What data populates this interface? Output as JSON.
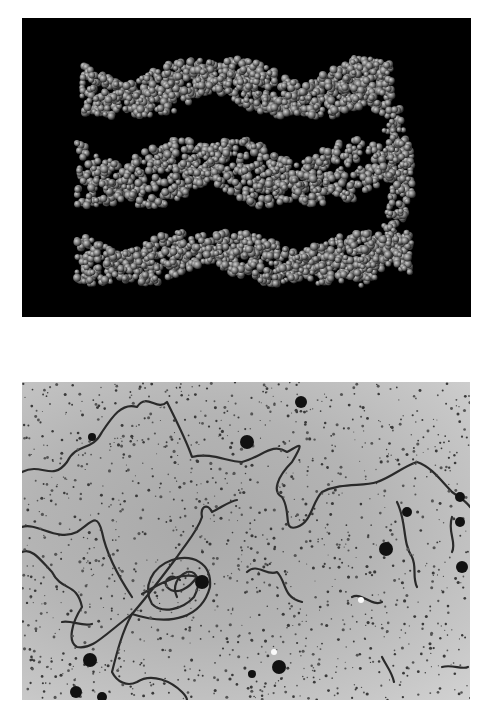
{
  "figure": {
    "panels": [
      {
        "id": "top",
        "description": "Space-filling molecular model of DNA helix segments (three stacked rows of gray atom spheres) on a black background",
        "background": "#000000",
        "atom_color": "#8a8a8a"
      },
      {
        "id": "bottom",
        "description": "Electron micrograph of long DNA strands with a looped/coiled region, on a speckled gray background with dark dots",
        "background": "#b5b5b5",
        "strand_color": "#2a2a2a"
      }
    ]
  }
}
